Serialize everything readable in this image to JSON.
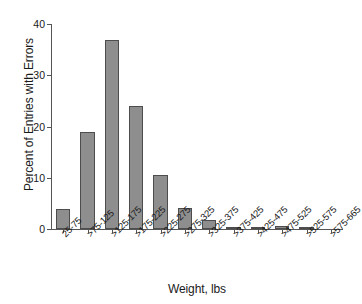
{
  "chart_data": {
    "type": "bar",
    "title": "",
    "xlabel": "Weight, lbs",
    "ylabel": "Percent of Entries with Errors",
    "categories": [
      "25-75",
      ">75-125",
      ">125-175",
      ">175-225",
      ">225-275",
      ">275-325",
      ">325-375",
      ">375-425",
      ">425-475",
      ">475-525",
      ">525-575",
      ">575-665"
    ],
    "values": [
      3.9,
      18.9,
      36.8,
      24.0,
      10.6,
      4.1,
      1.7,
      0.3,
      0.1,
      0.6,
      0.2,
      0.0
    ],
    "ylim": [
      0,
      40
    ],
    "yticks": [
      0,
      10,
      20,
      30,
      40
    ],
    "ytick_labels": [
      "0",
      "10",
      "20",
      "30",
      "40"
    ],
    "grid": false,
    "legend": false,
    "bar_color": "#8e8e8e",
    "bar_edge_color": "#4d4d4d",
    "axis_color": "#555555"
  }
}
